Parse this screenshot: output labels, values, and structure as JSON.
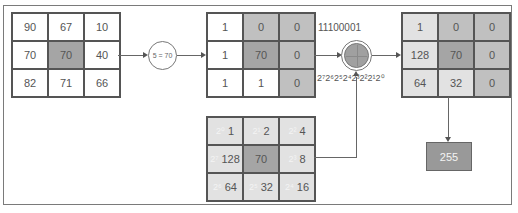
{
  "input_grid": {
    "cells": [
      "90",
      "67",
      "10",
      "70",
      "70",
      "40",
      "82",
      "71",
      "66"
    ]
  },
  "threshold_node": {
    "label": "5 = 70"
  },
  "binary_grid": {
    "cells": [
      "1",
      "0",
      "0",
      "1",
      "70",
      "0",
      "1",
      "1",
      "0"
    ]
  },
  "binary_code_label": "11100001",
  "powers_label": "2⁷2⁶2⁵2⁴2³2²2¹2⁰",
  "sum_node": {
    "label": ""
  },
  "weight_grid": {
    "cells": [
      {
        "power": "2⁰",
        "value": "1"
      },
      {
        "power": "2¹",
        "value": "2"
      },
      {
        "power": "2²",
        "value": "4"
      },
      {
        "power": "2⁷",
        "value": "128"
      },
      {
        "power": "",
        "value": "70"
      },
      {
        "power": "2³",
        "value": "8"
      },
      {
        "power": "2⁶",
        "value": "64"
      },
      {
        "power": "2⁵",
        "value": "32"
      },
      {
        "power": "2⁴",
        "value": "16"
      }
    ]
  },
  "result_grid": {
    "cells": [
      "1",
      "0",
      "0",
      "128",
      "70",
      "0",
      "64",
      "32",
      "0"
    ]
  },
  "output_value": "255",
  "colors": {
    "white": "#ffffff",
    "light": "#e2e2e2",
    "mid": "#c0c0c0",
    "dark": "#a5a5a5",
    "output_box": "#999999",
    "line": "#666666"
  }
}
